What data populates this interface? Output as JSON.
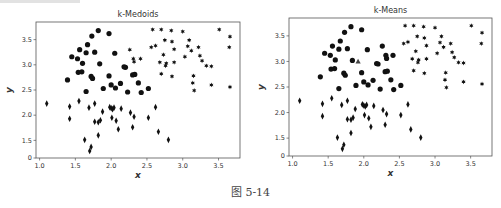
{
  "figure": {
    "caption": "图 5-14"
  },
  "chart_data": [
    {
      "type": "scatter",
      "title": "k-Medoids",
      "xlabel": "x",
      "ylabel": "y",
      "xlim": [
        0.95,
        3.8
      ],
      "ylim": [
        1.15,
        3.85
      ],
      "xticks": [
        "1.0",
        "1.5",
        "2.0",
        "2.5",
        "3.0",
        "3.5"
      ],
      "xtick_values": [
        1.0,
        1.5,
        2.0,
        2.5,
        3.0,
        3.5
      ],
      "yticks": [
        "0",
        "1.5",
        "2.0",
        "2.5",
        "3.0",
        "3.5"
      ],
      "ytick_values": [
        1.15,
        1.5,
        2.0,
        2.5,
        3.0,
        3.5
      ],
      "grid": false,
      "legend": null,
      "series": [
        {
          "name": "cluster-1",
          "marker": "circle",
          "points": [
            [
              1.82,
              3.68
            ],
            [
              1.73,
              3.57
            ],
            [
              1.97,
              3.62
            ],
            [
              1.67,
              3.4
            ],
            [
              1.56,
              3.3
            ],
            [
              1.65,
              3.24
            ],
            [
              1.77,
              3.25
            ],
            [
              2.05,
              3.23
            ],
            [
              1.45,
              3.16
            ],
            [
              1.53,
              3.12
            ],
            [
              1.6,
              3.03
            ],
            [
              1.84,
              3.02
            ],
            [
              1.54,
              2.85
            ],
            [
              1.59,
              2.86
            ],
            [
              1.72,
              2.77
            ],
            [
              1.74,
              2.73
            ],
            [
              1.97,
              2.78
            ],
            [
              2.2,
              2.95
            ],
            [
              2.18,
              2.96
            ],
            [
              2.3,
              2.8
            ],
            [
              2.33,
              2.81
            ],
            [
              1.39,
              2.7
            ],
            [
              1.65,
              2.47
            ],
            [
              1.89,
              2.53
            ],
            [
              2.0,
              2.6
            ],
            [
              2.06,
              2.54
            ],
            [
              2.13,
              2.63
            ],
            [
              2.23,
              2.46
            ],
            [
              2.38,
              2.64
            ],
            [
              2.42,
              2.45
            ],
            [
              2.52,
              2.53
            ]
          ]
        },
        {
          "name": "cluster-2",
          "marker": "diamond",
          "points": [
            [
              1.1,
              2.23
            ],
            [
              1.42,
              2.17
            ],
            [
              1.42,
              1.93
            ],
            [
              1.55,
              2.28
            ],
            [
              1.69,
              2.15
            ],
            [
              1.77,
              2.23
            ],
            [
              1.63,
              1.51
            ],
            [
              1.7,
              1.29
            ],
            [
              1.72,
              1.37
            ],
            [
              1.77,
              1.87
            ],
            [
              1.82,
              1.86
            ],
            [
              1.85,
              1.9
            ],
            [
              1.82,
              1.6
            ],
            [
              1.88,
              2.07
            ],
            [
              1.98,
              2.16
            ],
            [
              2.0,
              2.14
            ],
            [
              2.02,
              2.12
            ],
            [
              2.04,
              2.15
            ],
            [
              2.01,
              1.95
            ],
            [
              2.07,
              1.89
            ],
            [
              2.1,
              1.72
            ],
            [
              2.14,
              2.13
            ],
            [
              2.27,
              2.05
            ],
            [
              2.32,
              1.97
            ],
            [
              2.3,
              1.76
            ],
            [
              2.52,
              1.95
            ],
            [
              2.62,
              2.16
            ],
            [
              2.66,
              1.67
            ],
            [
              2.8,
              1.51
            ]
          ]
        },
        {
          "name": "cluster-3",
          "marker": "star",
          "points": [
            [
              2.26,
              3.3
            ],
            [
              2.31,
              3.12
            ],
            [
              2.32,
              3.06
            ],
            [
              2.41,
              3.12
            ],
            [
              2.56,
              3.35
            ],
            [
              2.58,
              3.7
            ],
            [
              2.62,
              3.38
            ],
            [
              2.68,
              3.05
            ],
            [
              2.7,
              3.7
            ],
            [
              2.7,
              2.82
            ],
            [
              2.73,
              3.2
            ],
            [
              2.75,
              3.49
            ],
            [
              2.76,
              2.98
            ],
            [
              2.77,
              3.03
            ],
            [
              2.84,
              3.68
            ],
            [
              2.85,
              3.46
            ],
            [
              2.85,
              2.77
            ],
            [
              2.88,
              3.31
            ],
            [
              2.88,
              3.05
            ],
            [
              3.0,
              3.66
            ],
            [
              3.03,
              3.16
            ],
            [
              3.07,
              3.37
            ],
            [
              3.09,
              3.49
            ],
            [
              3.12,
              3.28
            ],
            [
              3.14,
              2.64
            ],
            [
              3.15,
              2.78
            ],
            [
              3.16,
              2.49
            ],
            [
              3.22,
              3.35
            ],
            [
              3.24,
              3.18
            ],
            [
              3.27,
              3.08
            ],
            [
              3.33,
              2.98
            ],
            [
              3.4,
              2.97
            ],
            [
              3.4,
              2.6
            ],
            [
              3.51,
              3.7
            ],
            [
              3.66,
              3.56
            ],
            [
              3.65,
              3.35
            ],
            [
              3.66,
              2.56
            ]
          ]
        }
      ]
    },
    {
      "type": "scatter",
      "title": "k-Means",
      "xlabel": "x",
      "ylabel": "y",
      "xlim": [
        0.95,
        3.8
      ],
      "ylim": [
        1.15,
        3.85
      ],
      "xticks": [
        "1.0",
        "1.5",
        "2.0",
        "2.5",
        "3.0",
        "3.5"
      ],
      "xtick_values": [
        1.0,
        1.5,
        2.0,
        2.5,
        3.0,
        3.5
      ],
      "yticks": [
        "0",
        "1.5",
        "2.0",
        "2.5",
        "3.0",
        "3.5"
      ],
      "ytick_values": [
        1.15,
        1.5,
        2.0,
        2.5,
        3.0,
        3.5
      ],
      "grid": false,
      "legend": null,
      "series": [
        {
          "name": "cluster-1",
          "marker": "circle",
          "points": [
            [
              1.82,
              3.68
            ],
            [
              1.73,
              3.57
            ],
            [
              1.97,
              3.62
            ],
            [
              1.67,
              3.4
            ],
            [
              1.56,
              3.3
            ],
            [
              1.65,
              3.24
            ],
            [
              1.77,
              3.25
            ],
            [
              2.05,
              3.23
            ],
            [
              1.45,
              3.16
            ],
            [
              1.53,
              3.12
            ],
            [
              1.6,
              3.03
            ],
            [
              1.84,
              3.02
            ],
            [
              1.54,
              2.85
            ],
            [
              1.59,
              2.86
            ],
            [
              1.72,
              2.77
            ],
            [
              1.74,
              2.73
            ],
            [
              1.97,
              2.78
            ],
            [
              2.2,
              2.95
            ],
            [
              2.18,
              2.96
            ],
            [
              2.3,
              2.8
            ],
            [
              2.33,
              2.81
            ],
            [
              1.39,
              2.7
            ],
            [
              1.65,
              2.47
            ],
            [
              1.89,
              2.53
            ],
            [
              2.0,
              2.6
            ],
            [
              2.06,
              2.54
            ],
            [
              2.13,
              2.63
            ],
            [
              2.23,
              2.46
            ],
            [
              2.38,
              2.64
            ],
            [
              2.42,
              2.45
            ],
            [
              2.52,
              2.53
            ],
            [
              2.26,
              3.3
            ],
            [
              2.31,
              3.12
            ],
            [
              2.32,
              3.06
            ],
            [
              2.41,
              3.12
            ]
          ]
        },
        {
          "name": "cluster-2",
          "marker": "diamond",
          "points": [
            [
              1.1,
              2.23
            ],
            [
              1.42,
              2.17
            ],
            [
              1.42,
              1.93
            ],
            [
              1.55,
              2.28
            ],
            [
              1.69,
              2.15
            ],
            [
              1.77,
              2.23
            ],
            [
              1.63,
              1.51
            ],
            [
              1.7,
              1.29
            ],
            [
              1.72,
              1.37
            ],
            [
              1.77,
              1.87
            ],
            [
              1.82,
              1.86
            ],
            [
              1.85,
              1.9
            ],
            [
              1.82,
              1.6
            ],
            [
              1.88,
              2.07
            ],
            [
              1.98,
              2.16
            ],
            [
              2.0,
              2.14
            ],
            [
              2.02,
              2.12
            ],
            [
              2.04,
              2.15
            ],
            [
              2.01,
              1.95
            ],
            [
              2.07,
              1.89
            ],
            [
              2.1,
              1.72
            ],
            [
              2.14,
              2.13
            ],
            [
              2.27,
              2.05
            ],
            [
              2.32,
              1.97
            ],
            [
              2.3,
              1.76
            ],
            [
              2.52,
              1.95
            ],
            [
              2.62,
              2.16
            ],
            [
              2.66,
              1.67
            ],
            [
              2.8,
              1.51
            ]
          ]
        },
        {
          "name": "cluster-3",
          "marker": "star",
          "points": [
            [
              2.56,
              3.35
            ],
            [
              2.58,
              3.7
            ],
            [
              2.62,
              3.38
            ],
            [
              2.68,
              3.05
            ],
            [
              2.7,
              3.7
            ],
            [
              2.7,
              2.82
            ],
            [
              2.73,
              3.2
            ],
            [
              2.75,
              3.49
            ],
            [
              2.76,
              2.98
            ],
            [
              2.77,
              3.03
            ],
            [
              2.84,
              3.68
            ],
            [
              2.85,
              3.46
            ],
            [
              2.85,
              2.77
            ],
            [
              2.88,
              3.31
            ],
            [
              2.88,
              3.05
            ],
            [
              3.0,
              3.66
            ],
            [
              3.03,
              3.16
            ],
            [
              3.07,
              3.37
            ],
            [
              3.09,
              3.49
            ],
            [
              3.12,
              3.28
            ],
            [
              3.14,
              2.64
            ],
            [
              3.15,
              2.78
            ],
            [
              3.16,
              2.49
            ],
            [
              3.22,
              3.35
            ],
            [
              3.24,
              3.18
            ],
            [
              3.27,
              3.08
            ],
            [
              3.33,
              2.98
            ],
            [
              3.4,
              2.97
            ],
            [
              3.4,
              2.6
            ],
            [
              3.51,
              3.7
            ],
            [
              3.66,
              3.56
            ],
            [
              3.65,
              3.35
            ],
            [
              3.66,
              2.56
            ]
          ]
        },
        {
          "name": "centroid",
          "marker": "triangle",
          "points": [
            [
              1.92,
              3.0
            ]
          ]
        }
      ]
    }
  ],
  "layout": {
    "plots": [
      {
        "axes": {
          "left": 36,
          "top": 22,
          "right": 240,
          "bottom": 158
        }
      },
      {
        "axes": {
          "left": 37,
          "top": 18,
          "right": 240,
          "bottom": 156
        }
      }
    ],
    "marker_color": "#111111",
    "axis_color": "#555555"
  }
}
